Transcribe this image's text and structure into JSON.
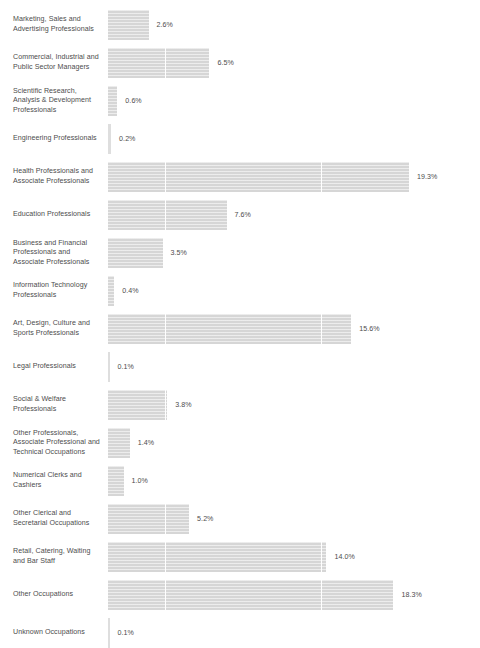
{
  "chart_data": {
    "type": "bar",
    "orientation": "horizontal",
    "title": "",
    "subtitle": "",
    "xlabel": "",
    "ylabel": "",
    "grid": false,
    "legend": null,
    "value_suffix": "%",
    "xlim": [
      0,
      19.3
    ],
    "px_per_unit": 15.6,
    "bar_color": "#d6d6d6",
    "separator_color": "#ffffff",
    "text_color": "#4d4d4d",
    "segment_interval": 10,
    "categories": [
      "Marketing, Sales and Advertising Professionals",
      "Commercial, Industrial and Public Sector Managers",
      "Scientific Research, Analysis & Development Professionals",
      "Engineering Professionals",
      "Health Professionals and Associate Professionals",
      "Education Professionals",
      "Business and Financial Professionals and Associate Professionals",
      "Information Technology Professionals",
      "Art, Design, Culture and Sports Professionals",
      "Legal Professionals",
      "Social & Welfare Professionals",
      "Other Professionals, Associate Professional and Technical Occupations",
      "Numerical Clerks and Cashiers",
      "Other Clerical and Secretarial Occupations",
      "Retail, Catering, Waiting and Bar Staff",
      "Other Occupations",
      "Unknown Occupations"
    ],
    "values": [
      2.6,
      6.5,
      0.6,
      0.2,
      19.3,
      7.6,
      3.5,
      0.4,
      15.6,
      0.1,
      3.8,
      1.4,
      1.0,
      5.2,
      14.0,
      18.3,
      0.1
    ],
    "value_labels": [
      "2.6%",
      "6.5%",
      "0.6%",
      "0.2%",
      "19.3%",
      "7.6%",
      "3.5%",
      "0.4%",
      "15.6%",
      "0.1%",
      "3.8%",
      "1.4%",
      "1.0%",
      "5.2%",
      "14.0%",
      "18.3%",
      "0.1%"
    ]
  },
  "rows": [
    {
      "label": "Marketing, Sales and Advertising Professionals",
      "value": 2.6,
      "value_label": "2.6%"
    },
    {
      "label": "Commercial, Industrial and Public Sector Managers",
      "value": 6.5,
      "value_label": "6.5%"
    },
    {
      "label": "Scientific Research, Analysis & Development Professionals",
      "value": 0.6,
      "value_label": "0.6%"
    },
    {
      "label": "Engineering Professionals",
      "value": 0.2,
      "value_label": "0.2%"
    },
    {
      "label": "Health Professionals and Associate Professionals",
      "value": 19.3,
      "value_label": "19.3%"
    },
    {
      "label": "Education Professionals",
      "value": 7.6,
      "value_label": "7.6%"
    },
    {
      "label": "Business and Financial Professionals and Associate Professionals",
      "value": 3.5,
      "value_label": "3.5%"
    },
    {
      "label": "Information Technology Professionals",
      "value": 0.4,
      "value_label": "0.4%"
    },
    {
      "label": "Art, Design, Culture and Sports Professionals",
      "value": 15.6,
      "value_label": "15.6%"
    },
    {
      "label": "Legal Professionals",
      "value": 0.1,
      "value_label": "0.1%"
    },
    {
      "label": "Social & Welfare Professionals",
      "value": 3.8,
      "value_label": "3.8%"
    },
    {
      "label": "Other Professionals, Associate Professional and Technical Occupations",
      "value": 1.4,
      "value_label": "1.4%"
    },
    {
      "label": "Numerical Clerks and Cashiers",
      "value": 1.0,
      "value_label": "1.0%"
    },
    {
      "label": "Other Clerical and Secretarial Occupations",
      "value": 5.2,
      "value_label": "5.2%"
    },
    {
      "label": "Retail, Catering, Waiting and Bar Staff",
      "value": 14.0,
      "value_label": "14.0%"
    },
    {
      "label": "Other Occupations",
      "value": 18.3,
      "value_label": "18.3%"
    },
    {
      "label": "Unknown Occupations",
      "value": 0.1,
      "value_label": "0.1%"
    }
  ]
}
